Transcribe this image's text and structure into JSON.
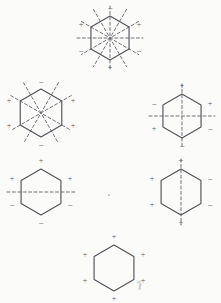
{
  "figure": {
    "sign_plus": "+",
    "sign_minus": "−",
    "stroke_color": "#55525a",
    "mirror_color": "#6d6a71",
    "background_color": "#fbfbfa",
    "hexagons": [
      {
        "id": "hexagon-top-center",
        "label": "top-center-ring",
        "mirror_count": 6,
        "mirror_types": [
          "vertical",
          "horizontal",
          "diagonal-60",
          "diagonal-120",
          "diagonal-30",
          "diagonal-150"
        ],
        "signs": {
          "top": "−",
          "upper_left": "+",
          "upper_right": "+",
          "lower_left": "−",
          "lower_right": "−",
          "bottom": "+"
        }
      },
      {
        "id": "hexagon-middle-left",
        "label": "middle-left-ring",
        "mirror_count": 4,
        "mirror_types": [
          "diagonal-60",
          "diagonal-120",
          "diagonal-30",
          "diagonal-150"
        ],
        "signs": {
          "top": "−",
          "upper_left": "+",
          "upper_right": "+",
          "lower_left": "+",
          "lower_right": "+",
          "bottom": "−"
        }
      },
      {
        "id": "hexagon-middle-right",
        "label": "middle-right-ring",
        "mirror_count": 2,
        "mirror_types": [
          "vertical",
          "horizontal"
        ],
        "signs": {
          "top": "+",
          "upper_left": "−",
          "upper_right": "+",
          "lower_left": "+",
          "lower_right": "−",
          "bottom": "−"
        }
      },
      {
        "id": "hexagon-lower-left",
        "label": "lower-left-ring",
        "mirror_count": 1,
        "mirror_types": [
          "horizontal"
        ],
        "signs": {
          "top": "+",
          "upper_left": "+",
          "upper_right": "+",
          "lower_left": "−",
          "lower_right": "−",
          "bottom": "−"
        }
      },
      {
        "id": "hexagon-lower-right",
        "label": "lower-right-ring",
        "mirror_count": 1,
        "mirror_types": [
          "vertical"
        ],
        "signs": {
          "top": "+",
          "upper_left": "+",
          "upper_right": "−",
          "lower_left": "+",
          "lower_right": "−",
          "bottom": "+"
        }
      },
      {
        "id": "hexagon-bottom-center",
        "label": "bottom-center-ring",
        "mirror_count": 0,
        "mirror_types": [],
        "signs": {
          "top": "+",
          "upper_left": "+",
          "upper_right": "+",
          "lower_left": "+",
          "lower_right": "+",
          "bottom": "+"
        }
      }
    ]
  }
}
